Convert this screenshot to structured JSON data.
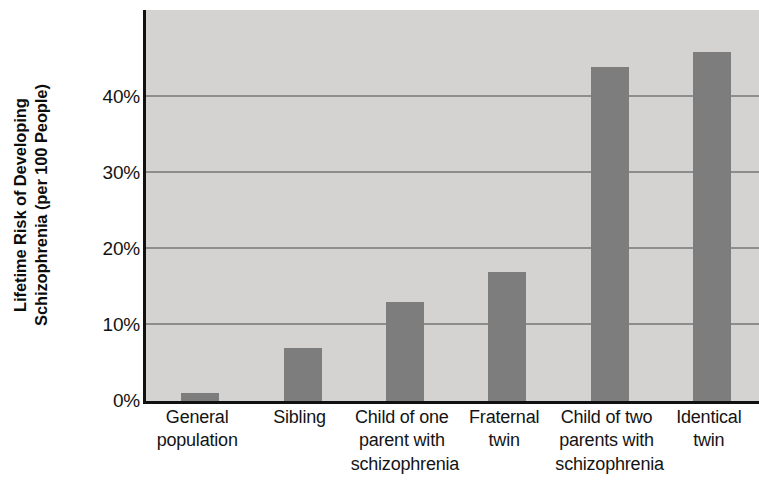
{
  "chart_data": {
    "type": "bar",
    "title": "",
    "xlabel": "",
    "ylabel": "Lifetime Risk of Developing Schizophrenia (per 100 People)",
    "ylabel_lines": [
      "Lifetime Risk of Developing",
      "Schizophrenia (per 100 People)"
    ],
    "categories": [
      "General population",
      "Sibling",
      "Child of one parent with schizophrenia",
      "Fraternal twin",
      "Child of two parents with schizophrenia",
      "Identical twin"
    ],
    "category_lines": [
      [
        "General",
        "population"
      ],
      [
        "Sibling"
      ],
      [
        "Child of one",
        "parent with",
        "schizophrenia"
      ],
      [
        "Fraternal",
        "twin"
      ],
      [
        "Child of two",
        "parents with",
        "schizophrenia"
      ],
      [
        "Identical",
        "twin"
      ]
    ],
    "values": [
      1,
      7,
      13,
      17,
      44,
      46
    ],
    "value_unit": "%",
    "ylim": [
      0,
      51.5
    ],
    "yticks": [
      0,
      10,
      20,
      30,
      40
    ],
    "ytick_labels": [
      "0%",
      "10%",
      "20%",
      "30%",
      "40%"
    ],
    "grid": true,
    "grid_axis": "y",
    "legend": "none",
    "colors": {
      "bar_fill": "#7d7d7d",
      "plot_background": "#d4d3d1",
      "gridline": "#8d8d8d",
      "axis_line": "#111111",
      "text": "#141414"
    }
  }
}
